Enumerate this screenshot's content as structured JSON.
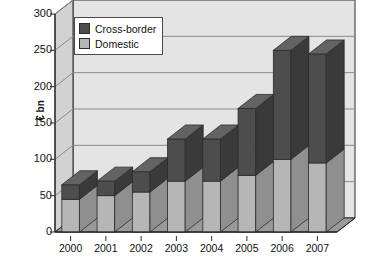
{
  "chart_data": {
    "type": "bar",
    "subtype": "stacked-column-3d",
    "title": "",
    "xlabel": "",
    "ylabel": "€ bn",
    "ylim": [
      0,
      300
    ],
    "ytick_step": 50,
    "yticks": [
      "0",
      "50",
      "100",
      "150",
      "200",
      "250",
      "300"
    ],
    "categories": [
      "2000",
      "2001",
      "2002",
      "2003",
      "2004",
      "2005",
      "2006",
      "2007"
    ],
    "grid": true,
    "legend_position": "top-left-inside",
    "series": [
      {
        "name": "Domestic",
        "values": [
          45,
          50,
          55,
          70,
          70,
          78,
          100,
          95
        ]
      },
      {
        "name": "Cross-border",
        "values": [
          20,
          20,
          28,
          58,
          58,
          92,
          150,
          150
        ]
      }
    ],
    "totals": [
      65,
      70,
      83,
      128,
      128,
      170,
      250,
      245
    ],
    "colors": {
      "domestic": "#b6b6b6",
      "cross_border": "#4d4d4d",
      "plot_background": "#e4e4e4",
      "wall_side": "#d2d2d2",
      "floor": "#9a9a9a",
      "gridline": "#8a8a8a",
      "axis": "#2b2b2b",
      "text": "#111111"
    }
  },
  "legend": {
    "items": [
      {
        "label": "Cross-border",
        "color": "#4d4d4d"
      },
      {
        "label": "Domestic",
        "color": "#b6b6b6"
      }
    ]
  }
}
